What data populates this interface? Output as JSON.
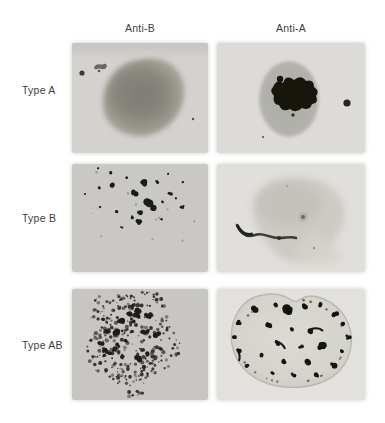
{
  "figure": {
    "type": "blood-typing-agglutination-panel",
    "text_color": "#3e3e3e",
    "columns": [
      {
        "label": "Anti-B"
      },
      {
        "label": "Anti-A"
      }
    ],
    "rows": [
      {
        "label": "Type A"
      },
      {
        "label": "Type B"
      },
      {
        "label": "Type AB"
      }
    ],
    "cells": [
      {
        "row": "Type A",
        "column": "Anti-B",
        "agglutination": false,
        "appearance": "smooth dark blob, no clumping; small ink specks upper left",
        "pattern": "smooth-blob",
        "bg": "#d3d2ce",
        "ink": "#8a897f",
        "accent": "#3b3a36"
      },
      {
        "row": "Type A",
        "column": "Anti-A",
        "agglutination": true,
        "appearance": "round drop with large central black agglutinate and side droplet",
        "pattern": "drop-central-clump",
        "bg": "#dcdbd7",
        "drop": "#b2b1ab",
        "ink": "#16160f"
      },
      {
        "row": "Type B",
        "column": "Anti-B",
        "agglutination": true,
        "appearance": "scattered black agglutinate clumps on gray field",
        "pattern": "scattered-clumps",
        "bg": "#c9c8c4",
        "ink": "#1d1c17"
      },
      {
        "row": "Type B",
        "column": "Anti-A",
        "agglutination": false,
        "appearance": "faint smooth drop with dark curved streak at lower-left edge",
        "pattern": "faint-blob-streak",
        "bg": "#e0dfdb",
        "drop": "#cbcac2",
        "ink": "#3a3a33"
      },
      {
        "row": "Type AB",
        "column": "Anti-B",
        "agglutination": true,
        "appearance": "dense fine speckled agglutination over whole drop",
        "pattern": "dense-speckle",
        "bg": "#c7c6c2",
        "ink": "#2b2a25"
      },
      {
        "row": "Type AB",
        "column": "Anti-A",
        "agglutination": true,
        "appearance": "bilobed heart-shaped drop with scattered black clumps",
        "pattern": "drop-ring-clumps",
        "bg": "#e2e1dd",
        "drop": "#d5d4cc",
        "ink": "#121210"
      }
    ]
  }
}
